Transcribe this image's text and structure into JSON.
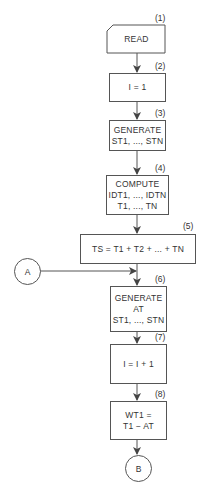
{
  "diagram": {
    "type": "flowchart",
    "steps": [
      {
        "number": "(1)",
        "lines": [
          "READ"
        ],
        "shape": "card"
      },
      {
        "number": "(2)",
        "lines": [
          "I = 1"
        ],
        "shape": "process"
      },
      {
        "number": "(3)",
        "lines": [
          "GENERATE",
          "ST1, ..., STN"
        ],
        "shape": "process"
      },
      {
        "number": "(4)",
        "lines": [
          "COMPUTE",
          "IDT1, ..., IDTN",
          "T1, ..., TN"
        ],
        "shape": "process"
      },
      {
        "number": "(5)",
        "lines": [
          "TS = T1 + T2 + ... + TN"
        ],
        "shape": "process"
      },
      {
        "number": "(6)",
        "lines": [
          "GENERATE",
          "AT",
          "ST1, ..., STN"
        ],
        "shape": "process"
      },
      {
        "number": "(7)",
        "lines": [
          "I = I + 1"
        ],
        "shape": "process"
      },
      {
        "number": "(8)",
        "lines": [
          "WT1 =",
          "T1 − AT"
        ],
        "shape": "process"
      }
    ],
    "connectors": {
      "entry": "A",
      "exit": "B"
    }
  }
}
